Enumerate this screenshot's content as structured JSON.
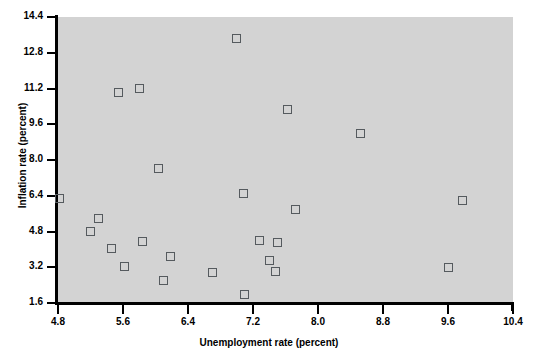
{
  "figure": {
    "plot_background": "#d3d3d3",
    "page_background": "#ffffff",
    "marker_color": "#555a5e",
    "axis_color": "#000000"
  },
  "axes": {
    "x": {
      "label": "Unemployment rate (percent)",
      "ticks": [
        "4.8",
        "5.6",
        "6.4",
        "7.2",
        "8.0",
        "8.8",
        "9.6",
        "10.4"
      ],
      "tick_values": [
        4.8,
        5.6,
        6.4,
        7.2,
        8.0,
        8.8,
        9.6,
        10.4
      ],
      "min": 4.8,
      "max": 10.4
    },
    "y": {
      "label": "Inflation rate (percent)",
      "ticks": [
        "14.4",
        "12.8",
        "11.2",
        "9.6",
        "8.0",
        "6.4",
        "4.8",
        "3.2",
        "1.6"
      ],
      "tick_values": [
        14.4,
        12.8,
        11.2,
        9.6,
        8.0,
        6.4,
        4.8,
        3.2,
        1.6
      ],
      "min": 1.6,
      "max": 14.4
    }
  },
  "chart_data": {
    "type": "scatter",
    "title": "",
    "xlabel": "Unemployment rate (percent)",
    "ylabel": "Inflation rate (percent)",
    "xlim": [
      4.8,
      10.4
    ],
    "ylim": [
      1.6,
      14.4
    ],
    "grid": false,
    "legend": null,
    "marker": "open-square",
    "series": [
      {
        "name": "observations",
        "points": [
          {
            "x": 4.82,
            "y": 6.27
          },
          {
            "x": 5.2,
            "y": 4.8
          },
          {
            "x": 5.3,
            "y": 5.4
          },
          {
            "x": 5.46,
            "y": 4.05
          },
          {
            "x": 5.54,
            "y": 11.03
          },
          {
            "x": 5.62,
            "y": 3.25
          },
          {
            "x": 5.8,
            "y": 11.22
          },
          {
            "x": 5.84,
            "y": 4.35
          },
          {
            "x": 6.04,
            "y": 7.6
          },
          {
            "x": 6.1,
            "y": 2.6
          },
          {
            "x": 6.18,
            "y": 3.67
          },
          {
            "x": 6.7,
            "y": 2.95
          },
          {
            "x": 7.0,
            "y": 13.46
          },
          {
            "x": 7.08,
            "y": 6.5
          },
          {
            "x": 7.1,
            "y": 1.98
          },
          {
            "x": 7.28,
            "y": 4.4
          },
          {
            "x": 7.4,
            "y": 3.48
          },
          {
            "x": 7.48,
            "y": 2.99
          },
          {
            "x": 7.5,
            "y": 4.33
          },
          {
            "x": 7.62,
            "y": 10.27
          },
          {
            "x": 7.72,
            "y": 5.79
          },
          {
            "x": 8.52,
            "y": 9.2
          },
          {
            "x": 9.6,
            "y": 3.17
          },
          {
            "x": 9.78,
            "y": 6.18
          }
        ]
      }
    ]
  }
}
